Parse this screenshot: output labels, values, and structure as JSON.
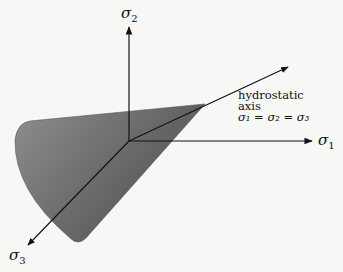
{
  "diagram": {
    "axes": [
      {
        "id": "sigma1",
        "symbol": "σ",
        "subscript": "1"
      },
      {
        "id": "sigma2",
        "symbol": "σ",
        "subscript": "2"
      },
      {
        "id": "sigma3",
        "symbol": "σ",
        "subscript": "3"
      }
    ],
    "hydrostatic_label": {
      "line1": "hydrostatic",
      "line2": "axis",
      "equation": "σ₁ = σ₂ = σ₃"
    },
    "colors": {
      "cone_light": "#9a9a9a",
      "cone_dark": "#4a4a4a",
      "axis": "#111111",
      "background": "#f7f7f5"
    }
  }
}
